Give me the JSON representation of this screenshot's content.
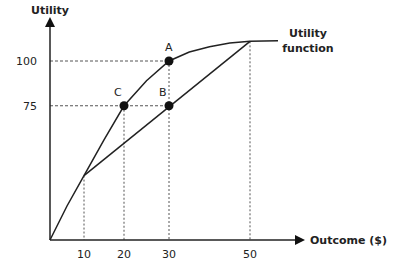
{
  "chart_data": {
    "type": "line",
    "title": "",
    "xlabel": "Outcome ($)",
    "ylabel": "Utility",
    "xlim": [
      0,
      55
    ],
    "ylim": [
      0,
      112
    ],
    "x_ticks": [
      10,
      20,
      30,
      50
    ],
    "y_ticks": [
      75,
      100
    ],
    "series": [
      {
        "name": "Utility function",
        "x": [
          0,
          10,
          20,
          30,
          40,
          50,
          57
        ],
        "values": [
          0,
          36,
          75,
          100,
          108,
          111,
          111
        ]
      },
      {
        "name": "Linear combination (10 to 50)",
        "x": [
          10,
          50
        ],
        "values": [
          36,
          111
        ]
      }
    ],
    "points": [
      {
        "label": "A",
        "x": 30,
        "y": 100
      },
      {
        "label": "B",
        "x": 30,
        "y": 75
      },
      {
        "label": "C",
        "x": 20,
        "y": 75
      }
    ],
    "reference_lines": {
      "vertical_x": [
        10,
        20,
        30,
        50
      ],
      "horizontal_y": [
        75,
        100
      ]
    },
    "curve_label": [
      "Utility",
      "function"
    ],
    "grid": false
  }
}
